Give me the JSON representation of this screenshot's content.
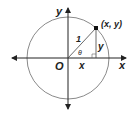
{
  "diagram": {
    "type": "unit-circle",
    "labels": {
      "y_axis": "y",
      "x_axis": "x",
      "origin": "O",
      "point": "(x, y)",
      "radius": "1",
      "angle": "θ",
      "horizontal_leg": "x",
      "vertical_leg": "y"
    },
    "colors": {
      "circle": "#8a8a8a",
      "axes": "#222222",
      "text": "#222222"
    }
  }
}
